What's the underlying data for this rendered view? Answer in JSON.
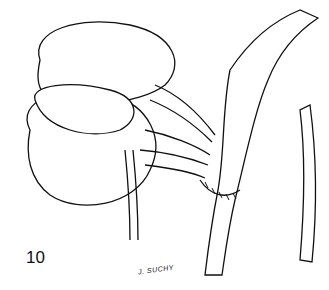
{
  "figure": {
    "number": "10",
    "signature": "J. SUCHY"
  }
}
